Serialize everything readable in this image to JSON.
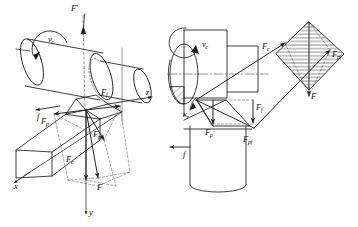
{
  "figure": {
    "domain": "engineering-diagram",
    "topic": "Cutting force resolution in turning (oblique view and plan view)",
    "line_color": "#1c1c1c",
    "dashed_color": "#6b6b6b",
    "hatch_color": "#2a2a2a",
    "background": "#ffffff"
  },
  "left_view": {
    "name": "oblique-3d-view",
    "labels": {
      "f_prime": "F",
      "f_prime_sup": "′",
      "vc": "v",
      "vc_sub": "c",
      "feed": "f",
      "force_f": "F",
      "force_f_sub": "f",
      "force_p": "F",
      "force_p_sub": "p",
      "force_pf": "F",
      "force_pf_sub": "pf",
      "force_c": "F",
      "force_c_sub": "c",
      "resultant": "F",
      "axis_x": "x",
      "axis_y": "y",
      "axis_z": "z"
    }
  },
  "right_view": {
    "name": "plan-view",
    "labels": {
      "vc": "v",
      "vc_sub": "c",
      "kappa_r": "κ",
      "kappa_r_sub": "r",
      "feed": "f",
      "force_c": "F",
      "force_c_sub": "c",
      "force_f": "F",
      "force_f_sub": "f",
      "force_p": "F",
      "force_p_sub": "p",
      "force_pf_low": "F",
      "force_pf_low_sub": "pf",
      "force_pf_right": "F",
      "force_pf_right_sub": "pf",
      "resultant": "F"
    }
  }
}
